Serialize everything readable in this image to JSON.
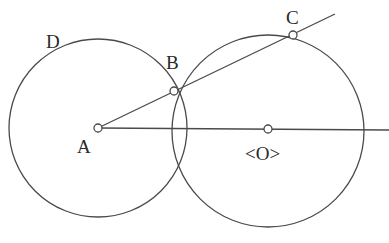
{
  "diagram": {
    "type": "geometry-construction",
    "colors": {
      "stroke": "#4a4a4a",
      "label": "#2a2a2a",
      "background": "#ffffff"
    },
    "points": [
      {
        "id": "A",
        "label": "A",
        "x": 98,
        "y": 128
      },
      {
        "id": "B",
        "label": "B",
        "x": 174,
        "y": 91
      },
      {
        "id": "C",
        "label": "C",
        "x": 293,
        "y": 35
      },
      {
        "id": "O",
        "label": "<O>",
        "x": 268,
        "y": 129
      }
    ],
    "circles": [
      {
        "id": "circle-A",
        "center": "A",
        "radius": 89,
        "label": "D"
      },
      {
        "id": "circle-O",
        "center": "O",
        "radius": 96
      }
    ],
    "lines": [
      {
        "id": "ray-ABC",
        "from": [
          98,
          128
        ],
        "to": [
          335,
          14
        ]
      },
      {
        "id": "ray-AO",
        "from": [
          98,
          128
        ],
        "to": [
          389,
          130
        ]
      }
    ],
    "labels": {
      "A": "A",
      "B": "B",
      "C": "C",
      "D": "D",
      "O": "<O>"
    }
  }
}
